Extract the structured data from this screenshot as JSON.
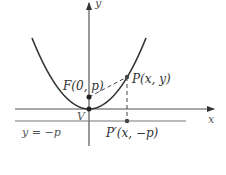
{
  "diagram": {
    "labels": {
      "y_axis": "y",
      "x_axis": "x",
      "focus": "F(0, p)",
      "point": "P(x, y)",
      "vertex": "V",
      "directrix": "y = −p",
      "projection": "P′(x, −p)"
    },
    "colors": {
      "curve": "#333333",
      "axes": "#444444",
      "directrix": "#666666",
      "dashed": "#444444"
    }
  }
}
